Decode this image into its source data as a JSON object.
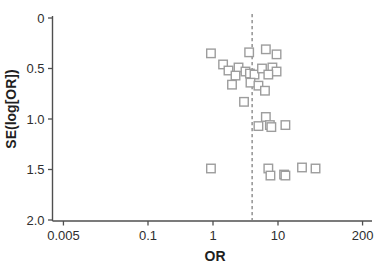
{
  "figure": {
    "background": "#ffffff"
  },
  "chart_data": {
    "type": "scatter",
    "title": "",
    "xlabel": "OR",
    "ylabel": "SE(log[OR])",
    "x_scale": "log",
    "y_inverted": true,
    "xlim": [
      0.005,
      200
    ],
    "ylim": [
      0,
      2.0
    ],
    "x_ticks": [
      0.005,
      0.1,
      1,
      10,
      200
    ],
    "x_tick_labels": [
      "0.005",
      "0.1",
      "1",
      "10",
      "200"
    ],
    "y_ticks": [
      0,
      0.5,
      1.0,
      1.5,
      2.0
    ],
    "y_tick_labels": [
      "0",
      "0.5",
      "1.0",
      "1.5",
      "2.0"
    ],
    "grid": false,
    "legend": "none",
    "reference_line": {
      "axis": "vertical",
      "value": 4.0,
      "style": "dashed"
    },
    "marker": {
      "shape": "open-square",
      "size_px": 8.5,
      "color": "#9d9d9d"
    },
    "points": [
      {
        "or": 0.93,
        "se": 0.35
      },
      {
        "or": 3.6,
        "se": 0.34
      },
      {
        "or": 6.5,
        "se": 0.31
      },
      {
        "or": 9.5,
        "se": 0.36
      },
      {
        "or": 1.43,
        "se": 0.46
      },
      {
        "or": 1.73,
        "se": 0.52
      },
      {
        "or": 2.47,
        "se": 0.49
      },
      {
        "or": 2.22,
        "se": 0.57
      },
      {
        "or": 3.16,
        "se": 0.53
      },
      {
        "or": 3.7,
        "se": 0.55
      },
      {
        "or": 4.35,
        "se": 0.56
      },
      {
        "or": 5.67,
        "se": 0.5
      },
      {
        "or": 8.2,
        "se": 0.49
      },
      {
        "or": 9.5,
        "se": 0.53
      },
      {
        "or": 7.1,
        "se": 0.56
      },
      {
        "or": 3.77,
        "se": 0.64
      },
      {
        "or": 5.0,
        "se": 0.67
      },
      {
        "or": 6.3,
        "se": 0.72
      },
      {
        "or": 1.96,
        "se": 0.66
      },
      {
        "or": 3.0,
        "se": 0.83
      },
      {
        "or": 6.5,
        "se": 0.98
      },
      {
        "or": 5.0,
        "se": 1.07
      },
      {
        "or": 7.5,
        "se": 1.06
      },
      {
        "or": 7.9,
        "se": 1.08
      },
      {
        "or": 13.0,
        "se": 1.06
      },
      {
        "or": 0.93,
        "se": 1.49
      },
      {
        "or": 7.1,
        "se": 1.49
      },
      {
        "or": 7.65,
        "se": 1.56
      },
      {
        "or": 12.4,
        "se": 1.55
      },
      {
        "or": 13.0,
        "se": 1.56
      },
      {
        "or": 23.4,
        "se": 1.48
      },
      {
        "or": 37.8,
        "se": 1.49
      }
    ]
  },
  "colors": {
    "axis": "#4f4f4f",
    "tick_label": "#2e2e2e",
    "marker": "#9d9d9d",
    "dashed_line": "#8a8a8a",
    "background": "#ffffff"
  }
}
